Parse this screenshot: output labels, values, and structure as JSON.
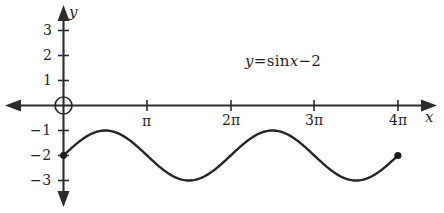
{
  "chart_data": {
    "type": "line",
    "title": "",
    "equation_label": "y = sin x − 2",
    "equation_parts": {
      "y": "y",
      "equals": "=",
      "sin": "sin",
      "x": "x",
      "minus": "−",
      "constant": "2"
    },
    "xlabel": "x",
    "ylabel": "y",
    "xlim": [
      -0.66,
      14.1
    ],
    "ylim": [
      -3.9,
      3.6
    ],
    "grid": false,
    "legend": "none",
    "x_tick_labels": [
      "π",
      "2π",
      "3π",
      "4π"
    ],
    "x_tick_values": [
      3.14159,
      6.28319,
      9.42478,
      12.56637
    ],
    "y_tick_labels": [
      "3",
      "2",
      "1",
      "−1",
      "−2",
      "−3"
    ],
    "y_tick_values": [
      3,
      2,
      1,
      -1,
      -2,
      -3
    ],
    "origin_marked": true,
    "origin_marker": "circle",
    "series": [
      {
        "name": "y = sin x − 2",
        "function": "sin(x) - 2",
        "domain": [
          0,
          12.56637
        ],
        "amplitude": 1,
        "period": 6.28319,
        "vertical_shift": -2,
        "max_value": -1,
        "min_value": -3,
        "endpoints": [
          {
            "x": 0,
            "y": -2,
            "marker": "filled-dot"
          },
          {
            "x": 12.56637,
            "y": -2,
            "marker": "filled-dot"
          }
        ],
        "key_points": [
          {
            "x": 0,
            "y": -2
          },
          {
            "x": 1.5708,
            "y": -1
          },
          {
            "x": 3.14159,
            "y": -2
          },
          {
            "x": 4.71239,
            "y": -3
          },
          {
            "x": 6.28319,
            "y": -2
          },
          {
            "x": 7.85398,
            "y": -1
          },
          {
            "x": 9.42478,
            "y": -2
          },
          {
            "x": 10.99557,
            "y": -3
          },
          {
            "x": 12.56637,
            "y": -2
          }
        ]
      }
    ],
    "colors": {
      "curve": "#262626",
      "axis": "#2b2b2b",
      "text": "#1f1f1f",
      "background": "#ffffff"
    }
  }
}
